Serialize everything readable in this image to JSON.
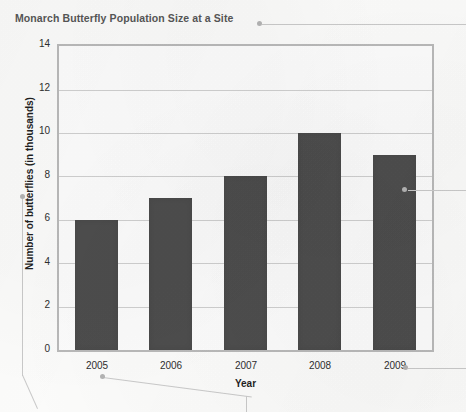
{
  "chart_data": {
    "type": "bar",
    "title": "Monarch Butterfly Population Size at a Site",
    "xlabel": "Year",
    "ylabel": "Number of butterflies (in thousands)",
    "categories": [
      "2005",
      "2006",
      "2007",
      "2008",
      "2009"
    ],
    "values": [
      6,
      7,
      8,
      10,
      9
    ],
    "ylim": [
      0,
      14
    ],
    "ytick_labels": [
      "0",
      "2",
      "4",
      "6",
      "8",
      "10",
      "12",
      "14"
    ],
    "ytick_values": [
      0,
      2,
      4,
      6,
      8,
      10,
      12,
      14
    ],
    "grid": true,
    "legend": "none",
    "bar_color": "#4d4d4d",
    "grid_color": "#cfcfcf",
    "frame_color": "#b9b9b9",
    "title_color": "#565656",
    "background_color": "#fbfbfa",
    "annotations": [
      {
        "name": "title-callout",
        "target": "chart-title"
      },
      {
        "name": "y-axis-callout",
        "target": "y-axis-title"
      },
      {
        "name": "x-2005-callout",
        "target": "xtick-2005"
      },
      {
        "name": "x-2009-callout",
        "target": "xtick-2009"
      },
      {
        "name": "bar-2009-callout",
        "target": "bar-2009"
      }
    ]
  }
}
